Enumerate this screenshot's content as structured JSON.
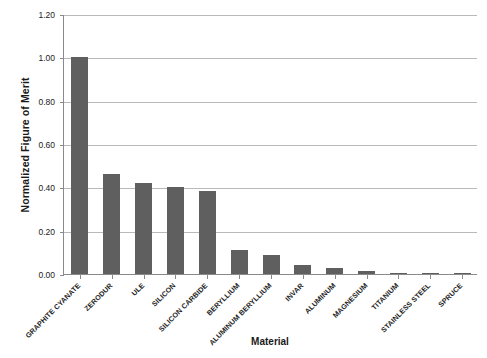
{
  "chart_data": {
    "type": "bar",
    "title": "",
    "xlabel": "Material",
    "ylabel": "Normalized Figure of Merit",
    "ylim": [
      0.0,
      1.2
    ],
    "ytick_labels": [
      "1.20",
      "1.00",
      "0.80",
      "0.60",
      "0.40",
      "0.20",
      "0.00"
    ],
    "ytick_values": [
      1.2,
      1.0,
      0.8,
      0.6,
      0.4,
      0.2,
      0.0
    ],
    "grid": "horizontal",
    "legend": "none",
    "bar_color": "#5f5f5f",
    "categories": [
      "GRAPHITE CYANATE",
      "ZERODUR",
      "ULE",
      "SILICON",
      "SILICON CARBIDE",
      "BERYLLIUM",
      "ALUMINUM BERYLLIUM",
      "INVAR",
      "ALUMINUM",
      "MAGNESIUM",
      "TITANIUM",
      "STAINLESS STEEL",
      "SPRUCE"
    ],
    "values": [
      1.0,
      0.46,
      0.42,
      0.4,
      0.385,
      0.11,
      0.09,
      0.04,
      0.03,
      0.015,
      0.005,
      0.005,
      0.002
    ]
  }
}
